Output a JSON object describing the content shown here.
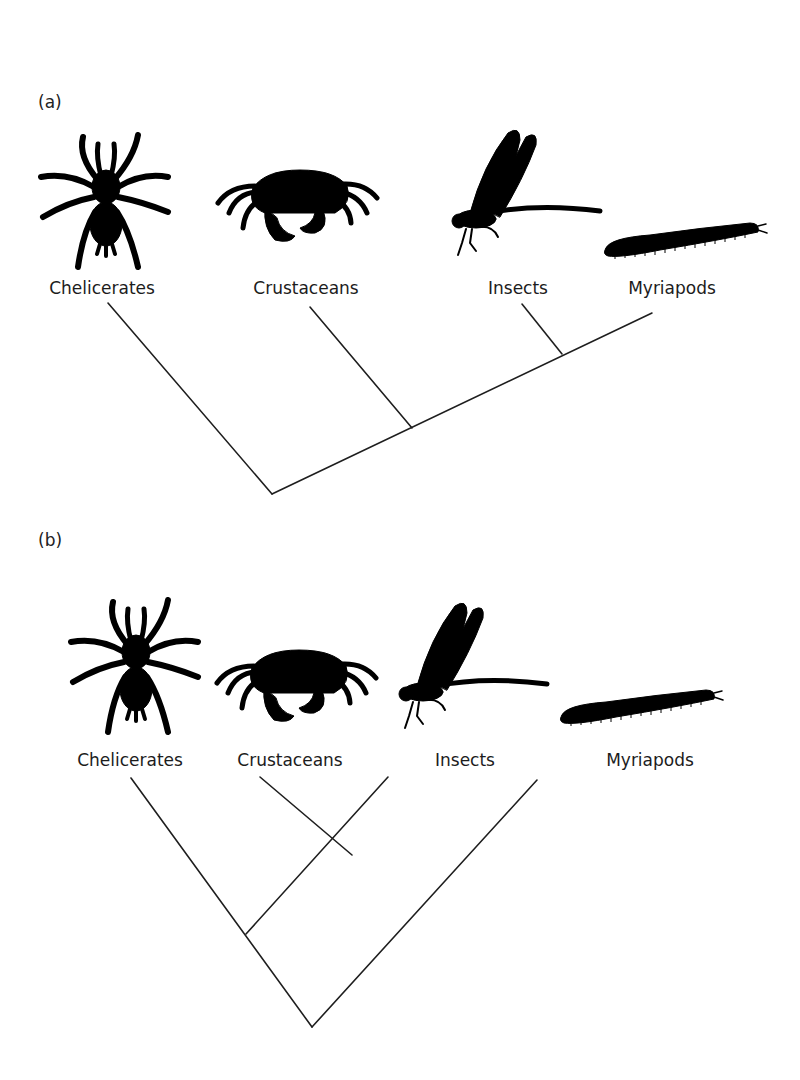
{
  "panels": [
    {
      "label": "(a)",
      "taxa": [
        {
          "name": "Chelicerates",
          "icon": "spider-icon"
        },
        {
          "name": "Crustaceans",
          "icon": "crab-icon"
        },
        {
          "name": "Insects",
          "icon": "damselfly-icon"
        },
        {
          "name": "Myriapods",
          "icon": "millipede-icon"
        }
      ],
      "topology": "(Chelicerates,(Crustaceans,(Insects,Myriapods)))"
    },
    {
      "label": "(b)",
      "taxa": [
        {
          "name": "Chelicerates",
          "icon": "spider-icon"
        },
        {
          "name": "Crustaceans",
          "icon": "crab-icon"
        },
        {
          "name": "Insects",
          "icon": "damselfly-icon"
        },
        {
          "name": "Myriapods",
          "icon": "millipede-icon"
        }
      ],
      "topology": "(Myriapods,(Chelicerates,(Crustaceans,Insects)))"
    }
  ],
  "colors": {
    "background": "#ffffff",
    "line": "#1e1e1e",
    "silhouette": "#000000",
    "text": "#1c1c1c"
  }
}
